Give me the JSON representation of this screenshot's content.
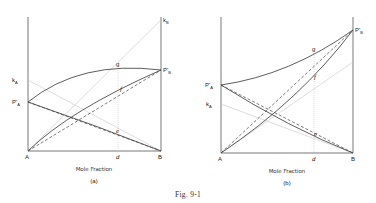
{
  "figure": {
    "caption": "Fig. 9-1",
    "xlabel": "Mole Fraction"
  },
  "panels": [
    {
      "id": "a",
      "sublabel": "(a)",
      "corner_left": "A",
      "corner_right": "B",
      "d_label": "d",
      "points": {
        "kA": {
          "label": "k",
          "sub": "A"
        },
        "PA": {
          "label": "P'",
          "sub": "A"
        },
        "kB": {
          "label": "k",
          "sub": "B"
        },
        "PB": {
          "label": "P'",
          "sub": "B"
        },
        "g": "g",
        "f": "f",
        "e": "e"
      },
      "description": "Negative deviation: total pressure curve below Raoult's line ends; partial pressure curves with Henry's law tangents"
    },
    {
      "id": "b",
      "sublabel": "(b)",
      "corner_left": "A",
      "corner_right": "B",
      "d_label": "d",
      "points": {
        "kA": {
          "label": "k",
          "sub": "A"
        },
        "PA": {
          "label": "P'",
          "sub": "A"
        },
        "kB": {
          "label": "k",
          "sub": "B"
        },
        "PB": {
          "label": "P'",
          "sub": "B"
        },
        "g": "g",
        "f": "f",
        "e": "e"
      },
      "description": "Positive-curvature total pressure curve; partial pressure curves with Henry's law lines"
    }
  ],
  "colors": {
    "curve": "#333333",
    "dashed": "#444444",
    "faint": "#c8c8c8",
    "axis": "#555555"
  }
}
